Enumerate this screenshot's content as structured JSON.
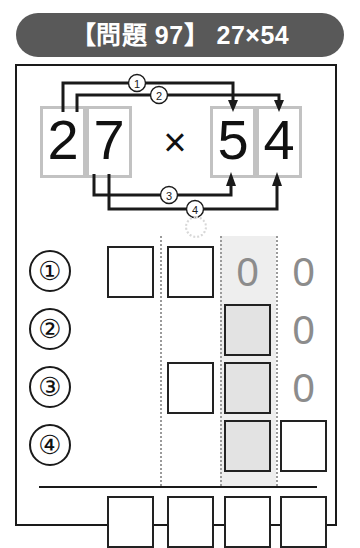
{
  "header": {
    "title": "【問題 97】 27×54",
    "bracket_open": "【",
    "label": "問題",
    "number": "97",
    "bracket_close": "】",
    "expression": "27×54",
    "pill_color": "#595959",
    "text_color": "#ffffff"
  },
  "expression": {
    "multiplicand": "27",
    "multiplier": "54",
    "operator": "×",
    "digits": {
      "a_tens": "2",
      "a_ones": "7",
      "b_tens": "5",
      "b_ones": "4"
    },
    "cell_border_color": "#c2c2c2",
    "arrows": [
      {
        "id": "1",
        "label": "①",
        "from": "a_tens",
        "to": "b_tens",
        "direction": "down"
      },
      {
        "id": "2",
        "label": "②",
        "from": "a_ones",
        "to": "b_ones",
        "direction": "down"
      },
      {
        "id": "3",
        "label": "③",
        "from": "a_ones",
        "to": "b_tens",
        "direction": "up"
      },
      {
        "id": "4",
        "label": "④",
        "from": "a_ones",
        "to": "b_ones",
        "direction": "up"
      }
    ]
  },
  "grid": {
    "column_count": 4,
    "highlight_column_index": 3,
    "highlight_color": "#eeeeee",
    "filled_box_color": "#e3e3e3",
    "zero_glyph": "0",
    "zero_color": "#8c8c8c",
    "rows": [
      {
        "badge": "①",
        "cells": [
          {
            "type": "box",
            "fill": "white",
            "value": ""
          },
          {
            "type": "box",
            "fill": "white",
            "value": ""
          },
          {
            "type": "zero",
            "value": "0"
          },
          {
            "type": "zero",
            "value": "0"
          }
        ]
      },
      {
        "badge": "②",
        "cells": [
          {
            "type": "empty",
            "value": ""
          },
          {
            "type": "empty",
            "value": ""
          },
          {
            "type": "box",
            "fill": "gray",
            "value": ""
          },
          {
            "type": "zero",
            "value": "0"
          }
        ]
      },
      {
        "badge": "③",
        "cells": [
          {
            "type": "empty",
            "value": ""
          },
          {
            "type": "box",
            "fill": "white",
            "value": ""
          },
          {
            "type": "box",
            "fill": "gray",
            "value": ""
          },
          {
            "type": "zero",
            "value": "0"
          }
        ]
      },
      {
        "badge": "④",
        "cells": [
          {
            "type": "empty",
            "value": ""
          },
          {
            "type": "empty",
            "value": ""
          },
          {
            "type": "box",
            "fill": "gray",
            "value": ""
          },
          {
            "type": "box",
            "fill": "white",
            "value": ""
          }
        ]
      }
    ],
    "answer_row": {
      "cells": [
        {
          "type": "box",
          "fill": "white",
          "value": ""
        },
        {
          "type": "box",
          "fill": "white",
          "value": ""
        },
        {
          "type": "box",
          "fill": "white",
          "value": ""
        },
        {
          "type": "box",
          "fill": "white",
          "value": ""
        }
      ]
    }
  }
}
